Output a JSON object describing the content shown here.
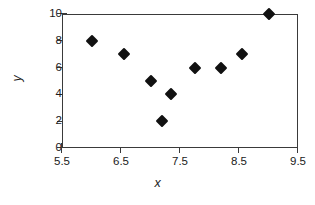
{
  "chart_data": {
    "type": "scatter",
    "title": "",
    "xlabel": "x",
    "ylabel": "y",
    "xlim": [
      5.5,
      9.5
    ],
    "ylim": [
      0,
      10
    ],
    "xticks": [
      "5.5",
      "6.5",
      "7.5",
      "8.5",
      "9.5"
    ],
    "xtick_values": [
      5.5,
      6.5,
      7.5,
      8.5,
      9.5
    ],
    "yticks": [
      "0",
      "2",
      "4",
      "6",
      "8",
      "10"
    ],
    "ytick_values": [
      0,
      2,
      4,
      6,
      8,
      10
    ],
    "grid": false,
    "legend": false,
    "marker_shape": "diamond",
    "marker_color": "#111111",
    "axis_color": "#3a3a3a",
    "background_color": "#ffffff",
    "points": [
      {
        "x": 6.0,
        "y": 8,
        "label": "(6.0, 8)"
      },
      {
        "x": 6.55,
        "y": 7,
        "label": "(6.55, 7)"
      },
      {
        "x": 7.0,
        "y": 5,
        "label": "(7.0, 5)"
      },
      {
        "x": 7.2,
        "y": 2,
        "label": "(7.2, 2)"
      },
      {
        "x": 7.35,
        "y": 4,
        "label": "(7.35, 4)"
      },
      {
        "x": 7.75,
        "y": 6,
        "label": "(7.75, 6)"
      },
      {
        "x": 8.2,
        "y": 6,
        "label": "(8.2, 6)"
      },
      {
        "x": 8.55,
        "y": 7,
        "label": "(8.55, 7)"
      },
      {
        "x": 9.0,
        "y": 10,
        "label": "(9.0, 10)"
      }
    ]
  }
}
